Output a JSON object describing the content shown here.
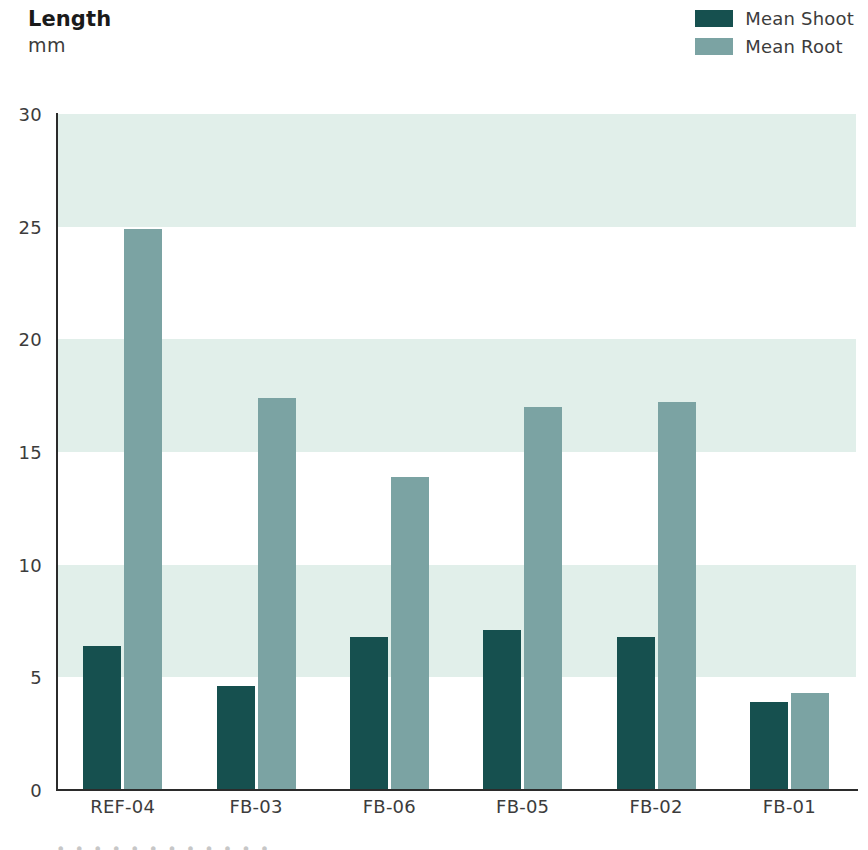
{
  "chart_data": {
    "type": "bar",
    "title": "Length",
    "subtitle": "mm",
    "xlabel": "",
    "ylabel": "mm",
    "ylim": [
      0,
      30
    ],
    "ytick_step": 5,
    "yticks": [
      30,
      25,
      20,
      15,
      10,
      5,
      0
    ],
    "grid": "horizontal-bands",
    "legend_position": "top-right",
    "categories": [
      "REF-04",
      "FB-03",
      "FB-06",
      "FB-05",
      "FB-02",
      "FB-01"
    ],
    "series": [
      {
        "name": "Mean Shoot",
        "color": "#16504f",
        "values": [
          6.4,
          4.6,
          6.8,
          7.1,
          6.8,
          3.9
        ]
      },
      {
        "name": "Mean Root",
        "color": "#7ba3a3",
        "values": [
          24.9,
          17.4,
          13.9,
          17.0,
          17.2,
          4.3
        ]
      }
    ],
    "band_color": "#e1efea",
    "band_ranges": [
      [
        5,
        10
      ],
      [
        15,
        20
      ],
      [
        25,
        30
      ]
    ],
    "axis_color": "#2b2b2b",
    "background": "#ffffff"
  },
  "header": {
    "title": "Length",
    "subtitle": "mm"
  },
  "legend": {
    "items": [
      {
        "label": "Mean Shoot",
        "color": "#16504f"
      },
      {
        "label": "Mean Root",
        "color": "#7ba3a3"
      }
    ]
  },
  "footer": {
    "cut_text": "• • • • • • • • • • • •"
  }
}
